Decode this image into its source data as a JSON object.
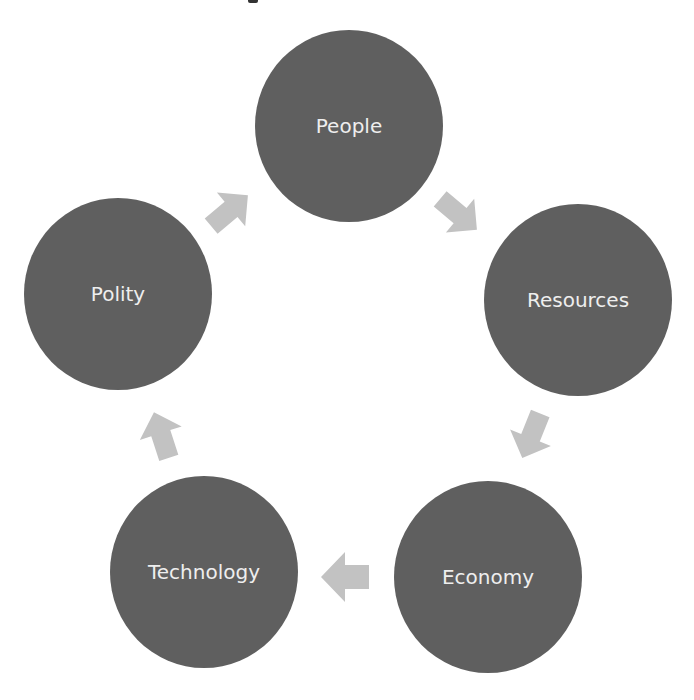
{
  "diagram": {
    "type": "cycle",
    "colors": {
      "node_fill": "#5f5f5f",
      "node_text": "#eeeeee",
      "arrow_fill": "#c2c2c2",
      "background": "#ffffff"
    },
    "nodes": [
      {
        "id": "people",
        "label": "People",
        "cx": 349,
        "cy": 126
      },
      {
        "id": "resources",
        "label": "Resources",
        "cx": 578,
        "cy": 300
      },
      {
        "id": "economy",
        "label": "Economy",
        "cx": 488,
        "cy": 577
      },
      {
        "id": "technology",
        "label": "Technology",
        "cx": 204,
        "cy": 572
      },
      {
        "id": "polity",
        "label": "Polity",
        "cx": 118,
        "cy": 294
      }
    ],
    "edges": [
      {
        "from": "Polity",
        "to": "People"
      },
      {
        "from": "People",
        "to": "Resources"
      },
      {
        "from": "Resources",
        "to": "Economy"
      },
      {
        "from": "Economy",
        "to": "Technology"
      },
      {
        "from": "Technology",
        "to": "Polity"
      }
    ]
  }
}
